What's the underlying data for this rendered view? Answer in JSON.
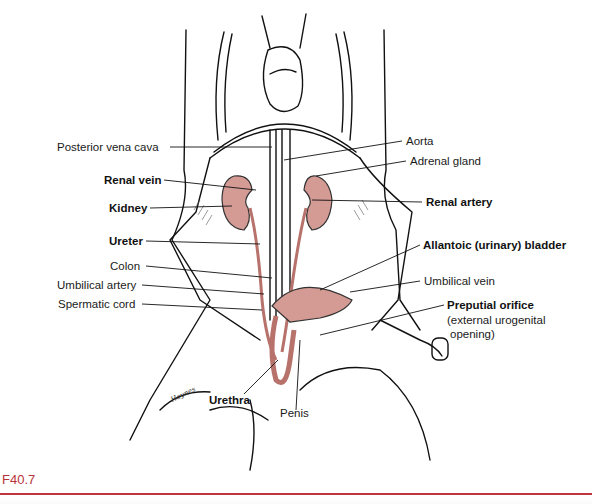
{
  "figure": {
    "id": "F40.7",
    "accent_color": "#c0353d",
    "organ_color": "#d49a94",
    "signature": "Haynes"
  },
  "labels": {
    "left": [
      {
        "text": "Posterior vena cava",
        "bold": false
      },
      {
        "text": "Renal vein",
        "bold": true
      },
      {
        "text": "Kidney",
        "bold": true
      },
      {
        "text": "Ureter",
        "bold": true
      },
      {
        "text": "Colon",
        "bold": false
      },
      {
        "text": "Umbilical artery",
        "bold": false
      },
      {
        "text": "Spermatic cord",
        "bold": false
      }
    ],
    "right": [
      {
        "text": "Aorta",
        "bold": false
      },
      {
        "text": "Adrenal gland",
        "bold": false
      },
      {
        "text": "Renal artery",
        "bold": true
      },
      {
        "text": "Allantoic (urinary) bladder",
        "bold": true
      },
      {
        "text": "Umbilical vein",
        "bold": false
      },
      {
        "text": "Preputial orifice",
        "bold": true
      },
      {
        "text": "(external urogenital",
        "bold": false
      },
      {
        "text": "opening)",
        "bold": false
      }
    ],
    "bottom": [
      {
        "text": "Urethra",
        "bold": true
      },
      {
        "text": "Penis",
        "bold": false
      }
    ]
  }
}
